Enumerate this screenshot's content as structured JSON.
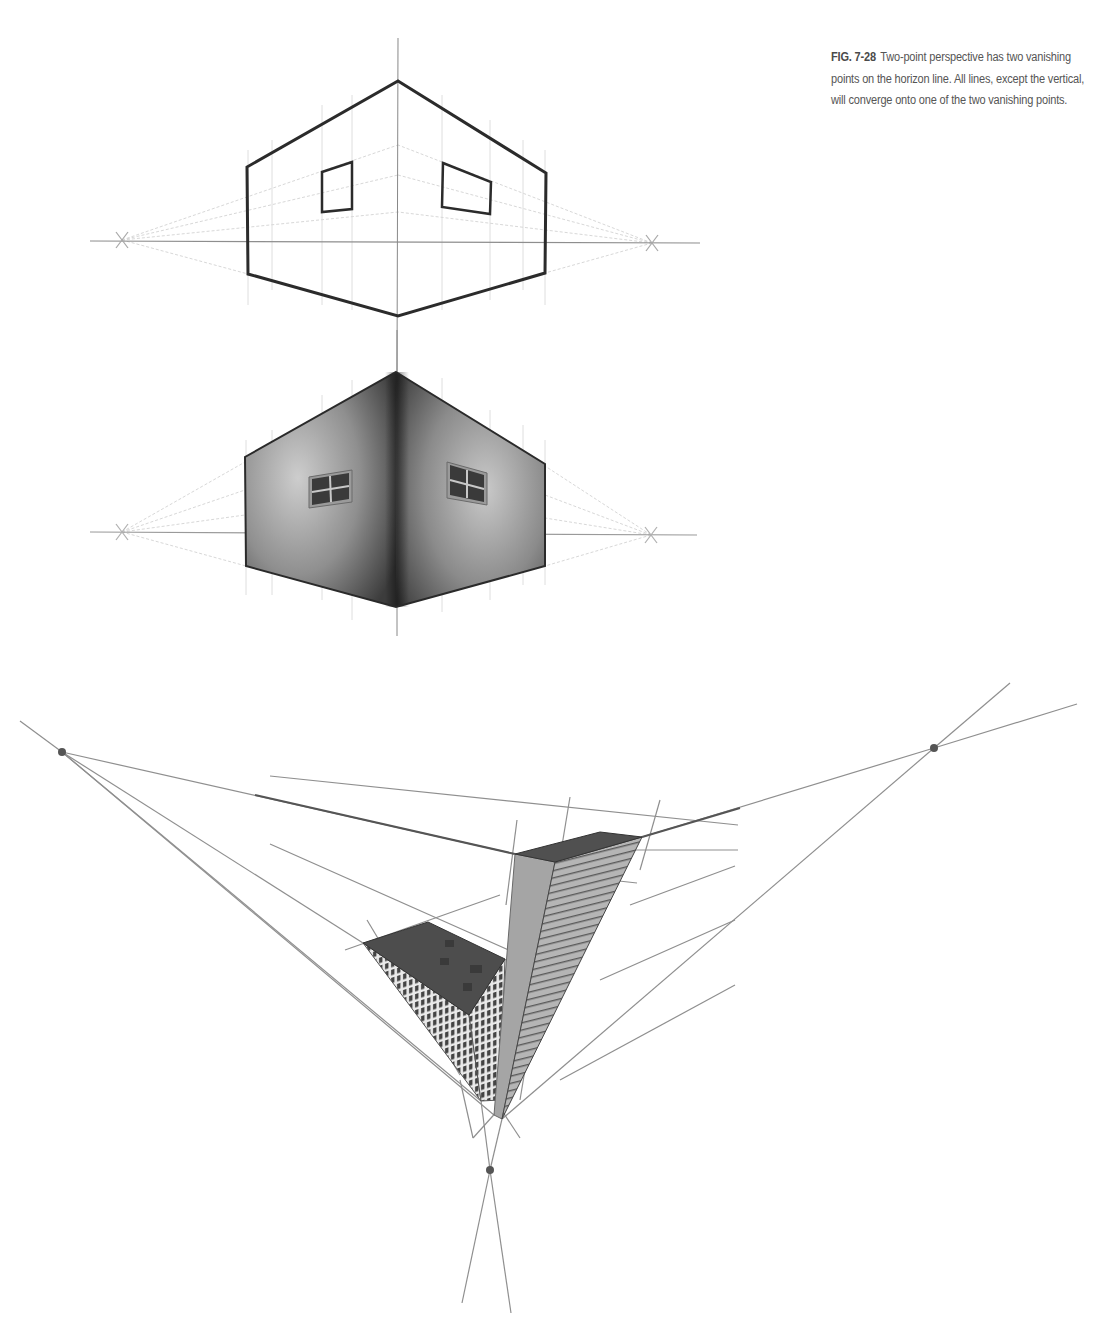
{
  "caption": {
    "label": "FIG. 7-28",
    "text": "Two-point perspective has two vanishing points on the horizon line. All lines, except the vertical, will converge onto one of the two vanishing points."
  },
  "colors": {
    "outline": "#2b2b2b",
    "guide": "#9a9a9a",
    "faint_guide": "#d4d4d4",
    "vanishing_dot": "#555555",
    "wall_dark": "#3a3a3a",
    "wall_mid": "#8a8a8a",
    "wall_light": "#c6c6c6",
    "roof": "#4a4a4a",
    "tower_face": "#a9a9a9"
  },
  "figures": [
    {
      "id": "two-point-line-drawing",
      "horizon": {
        "y": 242,
        "x1": 90,
        "x2": 700
      },
      "vanishing_points": [
        {
          "x": 122,
          "y": 240
        },
        {
          "x": 652,
          "y": 243
        }
      ],
      "vertical_axis": {
        "x": 398,
        "y1": 38,
        "y2": 372
      },
      "outline": [
        [
          398,
          81
        ],
        [
          546,
          173
        ],
        [
          545,
          273
        ],
        [
          398,
          316
        ],
        [
          248,
          274
        ],
        [
          247,
          167
        ]
      ],
      "windows": [
        [
          [
            322,
            172
          ],
          [
            352,
            162
          ],
          [
            352,
            209
          ],
          [
            322,
            212
          ]
        ],
        [
          [
            443,
            163
          ],
          [
            491,
            182
          ],
          [
            490,
            214
          ],
          [
            442,
            207
          ]
        ]
      ],
      "grid_x": [
        248,
        272,
        322,
        352,
        442,
        490,
        523,
        545
      ]
    },
    {
      "id": "two-point-shaded-building",
      "horizon": {
        "y": 533,
        "x1": 90,
        "x2": 697
      },
      "vanishing_points": [
        {
          "x": 122,
          "y": 532
        },
        {
          "x": 651,
          "y": 535
        }
      ],
      "vertical_axis": {
        "x": 397,
        "y1": 330,
        "y2": 636
      },
      "outline": [
        [
          396,
          372
        ],
        [
          545,
          464
        ],
        [
          545,
          566
        ],
        [
          396,
          607
        ],
        [
          246,
          566
        ],
        [
          245,
          457
        ]
      ],
      "windows": [
        {
          "x1": 309,
          "y1": 472,
          "x2": 352,
          "y2": 505,
          "skew": -1
        },
        {
          "x1": 447,
          "y1": 462,
          "x2": 487,
          "y2": 505,
          "skew": 1
        }
      ],
      "grid_x": [
        246,
        272,
        322,
        352,
        442,
        490,
        523,
        545
      ]
    },
    {
      "id": "three-point-skyscrapers",
      "vanishing_points": [
        {
          "x": 62,
          "y": 752
        },
        {
          "x": 934,
          "y": 748
        },
        {
          "x": 490,
          "y": 1170
        }
      ],
      "short_building": {
        "roof": [
          [
            363,
            943
          ],
          [
            428,
            922
          ],
          [
            505,
            959
          ],
          [
            469,
            1015
          ]
        ],
        "bottom": [
          481,
          1101
        ]
      },
      "tall_building": {
        "roof": [
          [
            515,
            854
          ],
          [
            600,
            832
          ],
          [
            642,
            837
          ],
          [
            555,
            862
          ]
        ],
        "bottom_left": [
          494,
          1115
        ],
        "bottom_front": [
          502,
          1119
        ]
      }
    }
  ]
}
